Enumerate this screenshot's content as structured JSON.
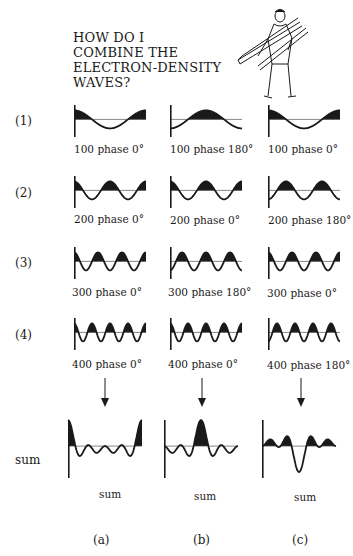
{
  "title": "HOW DO I\nCOMBINE THE\nELECTRON-DENSITY\nWAVES?",
  "illustration": "man-carrying-planks",
  "rows": [
    {
      "label": "(1)",
      "captions": [
        "100 phase 0°",
        "100 phase 180°",
        "100 phase 0°"
      ]
    },
    {
      "label": "(2)",
      "captions": [
        "200 phase 0°",
        "200 phase 0°",
        "200 phase 180°"
      ]
    },
    {
      "label": "(3)",
      "captions": [
        "300 phase 0°",
        "300 phase 180°",
        "300 phase 0°"
      ]
    },
    {
      "label": "(4)",
      "captions": [
        "400 phase 0°",
        "400 phase 0°",
        "400 phase 180°"
      ]
    }
  ],
  "sum_row": {
    "label": "sum",
    "captions": [
      "sum",
      "sum",
      "sum"
    ]
  },
  "columns": [
    "(a)",
    "(b)",
    "(c)"
  ],
  "colors": {
    "ink": "#1a1a1a",
    "background": "#ffffff"
  }
}
